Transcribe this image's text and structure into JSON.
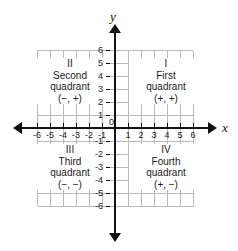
{
  "figure": {
    "axes": {
      "x_label": "x",
      "y_label": "y",
      "origin_label": "0",
      "x_ticks": [
        "-6",
        "-5",
        "-4",
        "-3",
        "-2",
        "-1",
        "1",
        "2",
        "3",
        "4",
        "5",
        "6"
      ],
      "y_ticks": [
        "6",
        "5",
        "4",
        "3",
        "2",
        "1",
        "-1",
        "-2",
        "-3",
        "-4",
        "-5",
        "-6"
      ],
      "x_range": [
        -6,
        6
      ],
      "y_range": [
        -6,
        6
      ],
      "grid": true,
      "grid_color": "#b9b9b9",
      "axis_color": "#111111"
    },
    "quadrants": [
      {
        "roman": "I",
        "name": "First",
        "word": "quadrant",
        "signs": "(+, +)"
      },
      {
        "roman": "II",
        "name": "Second",
        "word": "quadrant",
        "signs": "(−, +)"
      },
      {
        "roman": "III",
        "name": "Third",
        "word": "quadrant",
        "signs": "(−, −)"
      },
      {
        "roman": "IV",
        "name": "Fourth",
        "word": "quadrant",
        "signs": "(+, −)"
      }
    ]
  }
}
